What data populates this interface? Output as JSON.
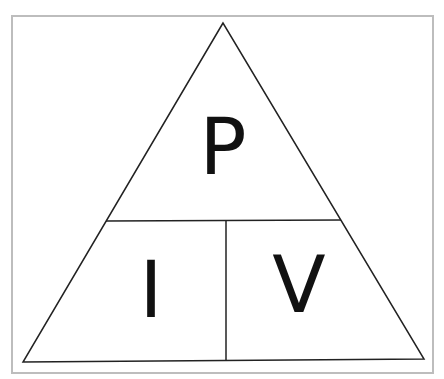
{
  "diagram": {
    "top": {
      "label": "P"
    },
    "bottom_left": {
      "label": "I"
    },
    "bottom_right": {
      "label": "V"
    },
    "colors": {
      "line": "#222222",
      "frame": "#bdbdbd",
      "text": "#111111"
    }
  }
}
